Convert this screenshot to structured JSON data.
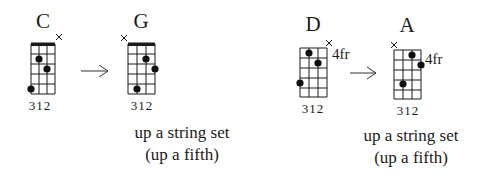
{
  "diagrams": [
    {
      "name": "C",
      "fingering": "312",
      "start_fret_label": "",
      "muted_string": 4,
      "dots": [
        {
          "string": 2,
          "fret": 2
        },
        {
          "string": 3,
          "fret": 3
        },
        {
          "string": 1,
          "fret": 5
        }
      ]
    },
    {
      "name": "G",
      "fingering": "312",
      "start_fret_label": "",
      "muted_string": 1,
      "dots": [
        {
          "string": 3,
          "fret": 2
        },
        {
          "string": 4,
          "fret": 3
        },
        {
          "string": 2,
          "fret": 5
        }
      ]
    },
    {
      "name": "D",
      "fingering": "312",
      "start_fret_label": "4fr",
      "muted_string": 4,
      "dots": [
        {
          "string": 2,
          "fret": 1
        },
        {
          "string": 3,
          "fret": 2
        },
        {
          "string": 1,
          "fret": 4
        }
      ]
    },
    {
      "name": "A",
      "fingering": "312",
      "start_fret_label": "4fr",
      "muted_string": 1,
      "dots": [
        {
          "string": 3,
          "fret": 1
        },
        {
          "string": 4,
          "fret": 2
        },
        {
          "string": 2,
          "fret": 4
        }
      ]
    }
  ],
  "captions": [
    {
      "line1": "up a string set",
      "line2": "(up a fifth)"
    },
    {
      "line1": "up a string set",
      "line2": "(up a fifth)"
    }
  ],
  "arrow_icon": "right-arrow"
}
